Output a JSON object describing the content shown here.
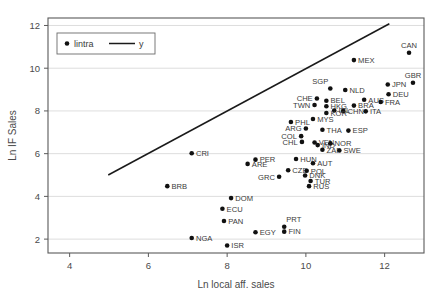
{
  "chart_data": {
    "type": "scatter",
    "title": "",
    "xlabel": "Ln local aff. sales",
    "ylabel": "Ln IF Sales",
    "xlim": [
      3.45,
      13.0
    ],
    "ylim": [
      1.35,
      12.35
    ],
    "xticks": [
      4,
      6,
      8,
      10,
      12
    ],
    "yticks": [
      2,
      4,
      6,
      8,
      10,
      12
    ],
    "grid": "horizontal",
    "legend": {
      "position": "top-left",
      "entries": [
        {
          "label": "lintra",
          "kind": "marker"
        },
        {
          "label": "y",
          "kind": "line"
        }
      ]
    },
    "series": [
      {
        "name": "lintra",
        "kind": "scatter",
        "points": [
          {
            "label": "CAN",
            "x": 12.62,
            "y": 10.72,
            "label_pos": "above"
          },
          {
            "label": "MEX",
            "x": 11.22,
            "y": 10.38,
            "label_pos": "right"
          },
          {
            "label": "GBR",
            "x": 12.72,
            "y": 9.32,
            "label_pos": "above"
          },
          {
            "label": "JPN",
            "x": 12.08,
            "y": 9.24,
            "label_pos": "right"
          },
          {
            "label": "SGP",
            "x": 10.62,
            "y": 9.05,
            "label_pos": "above-left"
          },
          {
            "label": "NLD",
            "x": 11.0,
            "y": 8.98,
            "label_pos": "right"
          },
          {
            "label": "DEU",
            "x": 12.1,
            "y": 8.78,
            "label_pos": "right"
          },
          {
            "label": "CHE",
            "x": 10.28,
            "y": 8.58,
            "label_pos": "left"
          },
          {
            "label": "BEL",
            "x": 10.52,
            "y": 8.48,
            "label_pos": "right"
          },
          {
            "label": "AUS",
            "x": 11.48,
            "y": 8.52,
            "label_pos": "right"
          },
          {
            "label": "FRA",
            "x": 11.9,
            "y": 8.42,
            "label_pos": "right"
          },
          {
            "label": "TWN",
            "x": 10.22,
            "y": 8.28,
            "label_pos": "left"
          },
          {
            "label": "HKG",
            "x": 10.52,
            "y": 8.22,
            "label_pos": "right"
          },
          {
            "label": "BRA",
            "x": 11.22,
            "y": 8.25,
            "label_pos": "right"
          },
          {
            "label": "IRL",
            "x": 10.72,
            "y": 8.02,
            "label_pos": "right"
          },
          {
            "label": "CHN",
            "x": 10.95,
            "y": 8.0,
            "label_pos": "right"
          },
          {
            "label": "ITA",
            "x": 11.52,
            "y": 7.98,
            "label_pos": "right"
          },
          {
            "label": "KOR",
            "x": 10.52,
            "y": 7.9,
            "label_pos": "right"
          },
          {
            "label": "MYS",
            "x": 10.18,
            "y": 7.62,
            "label_pos": "right"
          },
          {
            "label": "PHL",
            "x": 9.62,
            "y": 7.48,
            "label_pos": "right"
          },
          {
            "label": "ARG",
            "x": 10.0,
            "y": 7.18,
            "label_pos": "left"
          },
          {
            "label": "THA",
            "x": 10.42,
            "y": 7.12,
            "label_pos": "right"
          },
          {
            "label": "ESP",
            "x": 11.08,
            "y": 7.08,
            "label_pos": "right"
          },
          {
            "label": "COL",
            "x": 9.88,
            "y": 6.82,
            "label_pos": "left"
          },
          {
            "label": "CHL",
            "x": 9.9,
            "y": 6.55,
            "label_pos": "left"
          },
          {
            "label": "VEN",
            "x": 10.22,
            "y": 6.52,
            "label_pos": "right"
          },
          {
            "label": "IND",
            "x": 10.3,
            "y": 6.4,
            "label_pos": "right"
          },
          {
            "label": "NOR",
            "x": 10.62,
            "y": 6.48,
            "label_pos": "right"
          },
          {
            "label": "CRI",
            "x": 7.1,
            "y": 6.02,
            "label_pos": "right"
          },
          {
            "label": "ZAF",
            "x": 10.42,
            "y": 6.18,
            "label_pos": "right"
          },
          {
            "label": "SWE",
            "x": 10.85,
            "y": 6.15,
            "label_pos": "right"
          },
          {
            "label": "PER",
            "x": 8.72,
            "y": 5.72,
            "label_pos": "right"
          },
          {
            "label": "HUN",
            "x": 9.75,
            "y": 5.75,
            "label_pos": "right"
          },
          {
            "label": "ARE",
            "x": 8.52,
            "y": 5.52,
            "label_pos": "right"
          },
          {
            "label": "AUT",
            "x": 10.18,
            "y": 5.55,
            "label_pos": "right"
          },
          {
            "label": "CZE",
            "x": 9.55,
            "y": 5.22,
            "label_pos": "right"
          },
          {
            "label": "POL",
            "x": 10.02,
            "y": 5.2,
            "label_pos": "right"
          },
          {
            "label": "GRC",
            "x": 9.32,
            "y": 4.92,
            "label_pos": "left"
          },
          {
            "label": "DNK",
            "x": 9.98,
            "y": 4.98,
            "label_pos": "right"
          },
          {
            "label": "TUR",
            "x": 10.12,
            "y": 4.72,
            "label_pos": "right"
          },
          {
            "label": "RUS",
            "x": 10.08,
            "y": 4.48,
            "label_pos": "right"
          },
          {
            "label": "BRB",
            "x": 6.48,
            "y": 4.48,
            "label_pos": "right"
          },
          {
            "label": "DOM",
            "x": 8.1,
            "y": 3.92,
            "label_pos": "right"
          },
          {
            "label": "ECU",
            "x": 7.88,
            "y": 3.42,
            "label_pos": "right"
          },
          {
            "label": "PAN",
            "x": 7.92,
            "y": 2.85,
            "label_pos": "right"
          },
          {
            "label": "PRT",
            "x": 9.45,
            "y": 2.58,
            "label_pos": "above-right"
          },
          {
            "label": "FIN",
            "x": 9.45,
            "y": 2.35,
            "label_pos": "right"
          },
          {
            "label": "EGY",
            "x": 8.72,
            "y": 2.32,
            "label_pos": "right"
          },
          {
            "label": "NGA",
            "x": 7.1,
            "y": 2.05,
            "label_pos": "right"
          },
          {
            "label": "ISR",
            "x": 8.0,
            "y": 1.7,
            "label_pos": "right"
          }
        ]
      },
      {
        "name": "y",
        "kind": "line",
        "x": [
          4.98,
          12.12
        ],
        "y": [
          5.0,
          12.08
        ]
      }
    ]
  }
}
